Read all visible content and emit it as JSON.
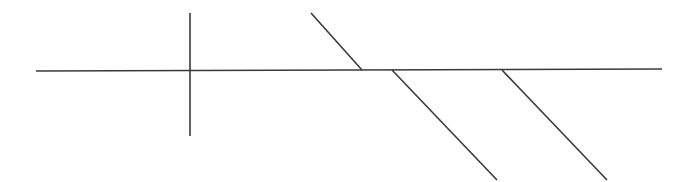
{
  "diagram": {
    "type": "line-drawing",
    "background": "#ffffff",
    "stroke_color": "#3a3a3a",
    "stroke_width": 1.6,
    "lines": [
      {
        "id": "main-horizontal",
        "x1": 36,
        "y1": 71,
        "x2": 662,
        "y2": 69
      },
      {
        "id": "vertical-cross",
        "x1": 190,
        "y1": 13,
        "x2": 190,
        "y2": 136
      },
      {
        "id": "upper-diagonal",
        "x1": 311,
        "y1": 13,
        "x2": 362,
        "y2": 70
      },
      {
        "id": "lower-diagonal-1",
        "x1": 392,
        "y1": 70,
        "x2": 497,
        "y2": 180
      },
      {
        "id": "lower-diagonal-2",
        "x1": 502,
        "y1": 70,
        "x2": 607,
        "y2": 180
      }
    ]
  }
}
